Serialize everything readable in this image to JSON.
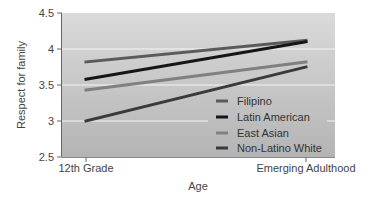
{
  "chart_data": {
    "type": "line",
    "title": "",
    "xlabel": "Age",
    "ylabel": "Respect for family",
    "categories": [
      "12th Grade",
      "Emerging Adulthood"
    ],
    "ylim": [
      2.5,
      4.5
    ],
    "yticks": [
      "2.5",
      "3",
      "3.5",
      "4",
      "4.5"
    ],
    "grid": true,
    "legend_position": "lower right (inside plot)",
    "series": [
      {
        "name": "Filipino",
        "values": [
          3.82,
          4.12
        ],
        "color": "#5a5a5a"
      },
      {
        "name": "Latin American",
        "values": [
          3.58,
          4.1
        ],
        "color": "#151515"
      },
      {
        "name": "East Asian",
        "values": [
          3.43,
          3.82
        ],
        "color": "#808080"
      },
      {
        "name": "Non-Latino White",
        "values": [
          3.0,
          3.75
        ],
        "color": "#3a3a3a"
      }
    ]
  },
  "axes": {
    "x_title": "Age",
    "y_title": "Respect for family",
    "x_ticks": [
      "12th Grade",
      "Emerging Adulthood"
    ],
    "y_ticks": [
      "4.5",
      "4",
      "3.5",
      "3",
      "2.5"
    ]
  },
  "legend": {
    "items": [
      {
        "label": "Filipino"
      },
      {
        "label": "Latin American"
      },
      {
        "label": "East Asian"
      },
      {
        "label": "Non-Latino White"
      }
    ]
  }
}
